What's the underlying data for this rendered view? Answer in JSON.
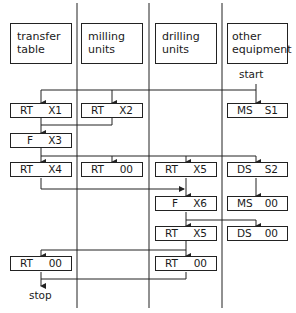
{
  "columns": [
    {
      "id": "transfer",
      "line1": "transfer",
      "line2": "table"
    },
    {
      "id": "milling",
      "line1": "milling",
      "line2": "units"
    },
    {
      "id": "drilling",
      "line1": "drilling",
      "line2": "units"
    },
    {
      "id": "other",
      "line1": "other",
      "line2": "equipment"
    }
  ],
  "labels": {
    "start": "start",
    "stop": "stop"
  },
  "steps": {
    "rt_x1": {
      "op": "RT",
      "arg": "X1"
    },
    "rt_x2": {
      "op": "RT",
      "arg": "X2"
    },
    "ms_s1": {
      "op": "MS",
      "arg": "S1"
    },
    "f_x3": {
      "op": "F",
      "arg": "X3"
    },
    "rt_x4": {
      "op": "RT",
      "arg": "X4"
    },
    "rt_00_mill": {
      "op": "RT",
      "arg": "00"
    },
    "rt_x5_a": {
      "op": "RT",
      "arg": "X5"
    },
    "ds_s2": {
      "op": "DS",
      "arg": "S2"
    },
    "f_x6": {
      "op": "F",
      "arg": "X6"
    },
    "ms_00": {
      "op": "MS",
      "arg": "00"
    },
    "rt_x5_b": {
      "op": "RT",
      "arg": "X5"
    },
    "ds_00": {
      "op": "DS",
      "arg": "00"
    },
    "rt_00_transfer": {
      "op": "RT",
      "arg": "00"
    },
    "rt_00_drill": {
      "op": "RT",
      "arg": "00"
    }
  }
}
